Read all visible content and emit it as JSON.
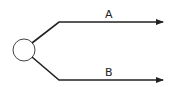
{
  "diagram": {
    "type": "branch",
    "node": {
      "shape": "circle",
      "label": ""
    },
    "branches": [
      {
        "label": "A",
        "direction": "up-right"
      },
      {
        "label": "B",
        "direction": "down-right"
      }
    ],
    "colors": {
      "line": "#222222",
      "background": "#ffffff"
    }
  }
}
